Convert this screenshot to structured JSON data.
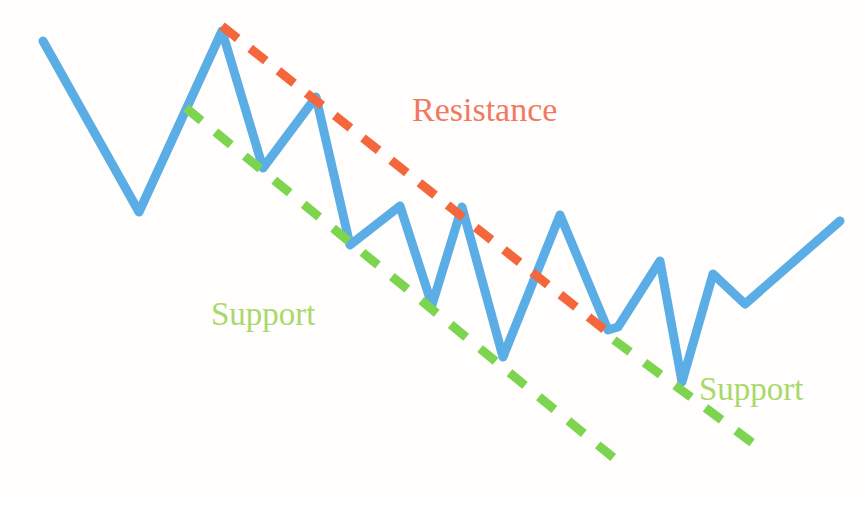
{
  "chart_data": {
    "type": "line",
    "title": "",
    "subtitle": "",
    "xlabel": "",
    "ylabel": "",
    "grid": false,
    "legend": "none",
    "axis_visible": false,
    "xlim": [
      0,
      862
    ],
    "ylim": [
      0,
      506
    ],
    "series": [
      {
        "name": "price-line",
        "type": "line",
        "color": "#5badE5",
        "stroke_width": 9,
        "points": [
          [
            43,
            41
          ],
          [
            139,
            212
          ],
          [
            222,
            31
          ],
          [
            263,
            168
          ],
          [
            316,
            97
          ],
          [
            350,
            245
          ],
          [
            400,
            206
          ],
          [
            432,
            305
          ],
          [
            462,
            207
          ],
          [
            503,
            357
          ],
          [
            560,
            215
          ],
          [
            608,
            330
          ],
          [
            618,
            327
          ],
          [
            660,
            261
          ],
          [
            682,
            382
          ],
          [
            713,
            274
          ],
          [
            745,
            304
          ],
          [
            840,
            221
          ]
        ]
      }
    ],
    "trendlines": [
      {
        "name": "resistance",
        "label": "Resistance",
        "color": "#f4663c",
        "style": "dashed",
        "stroke_width": 9,
        "dash": [
          20,
          16
        ],
        "from": [
          222,
          26
        ],
        "to": [
          615,
          338
        ],
        "slope": "descending",
        "connects": "lower highs"
      },
      {
        "name": "support-left",
        "label": "Support",
        "color": "#7dd44f",
        "style": "dashed",
        "stroke_width": 9,
        "dash": [
          20,
          18
        ],
        "from": [
          186,
          108
        ],
        "to": [
          626,
          468
        ],
        "slope": "descending",
        "connects": "lower lows"
      },
      {
        "name": "support-right",
        "label": "Support",
        "color": "#7dd44f",
        "style": "dashed",
        "stroke_width": 9,
        "dash": [
          20,
          18
        ],
        "from": [
          614,
          340
        ],
        "to": [
          754,
          444
        ],
        "slope": "descending",
        "connects": "lower lows continuation"
      }
    ],
    "annotations": [
      {
        "id": "resistance",
        "text": "Resistance",
        "color": "#f07a60",
        "x": 412,
        "y": 93,
        "font_size": 34
      },
      {
        "id": "support-left",
        "text": "Support",
        "color": "#a8d96a",
        "x": 211,
        "y": 298,
        "font_size": 33
      },
      {
        "id": "support-right",
        "text": "Support",
        "color": "#a8d96a",
        "x": 699,
        "y": 373,
        "font_size": 33
      }
    ],
    "colors": {
      "price_line": "#5badE5",
      "resistance": "#f4663c",
      "support": "#7dd44f",
      "resistance_text": "#f07a60",
      "support_text": "#a8d96a",
      "background": "#fffefd"
    }
  }
}
